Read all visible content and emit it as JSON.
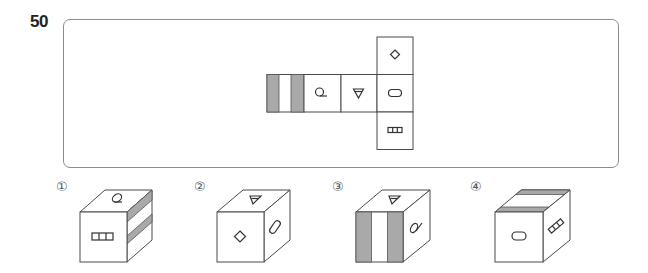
{
  "question": {
    "number": "50",
    "type": "cube-net folding puzzle"
  },
  "net": {
    "layout": "row of 4 faces with a vertical column of 3 faces on the rightmost; middle face shared",
    "faces": [
      {
        "id": "stripes",
        "position": "row-1",
        "symbol": "two vertical gray stripes (gray, white, gray)"
      },
      {
        "id": "loop",
        "position": "row-2",
        "symbol": "loop-with-tail (Q-like)"
      },
      {
        "id": "triangle",
        "position": "row-3",
        "symbol": "down-pointing triangle with inner line"
      },
      {
        "id": "diamond",
        "position": "column-top",
        "symbol": "diamond"
      },
      {
        "id": "oval",
        "position": "column-middle (row-4)",
        "symbol": "rounded rectangle / oval"
      },
      {
        "id": "grid",
        "position": "column-bottom",
        "symbol": "three-cell box grid"
      }
    ],
    "stripe_color": "#a9a9a9"
  },
  "options": [
    {
      "label": "①",
      "top": "loop",
      "front": "grid",
      "right": "stripes (horizontal)"
    },
    {
      "label": "②",
      "top": "triangle",
      "front": "diamond",
      "right": "oval"
    },
    {
      "label": "③",
      "top": "triangle",
      "front": "stripes (vertical)",
      "right": "loop"
    },
    {
      "label": "④",
      "top": "stripes (horizontal bands)",
      "front": "oval",
      "right": "grid"
    }
  ]
}
